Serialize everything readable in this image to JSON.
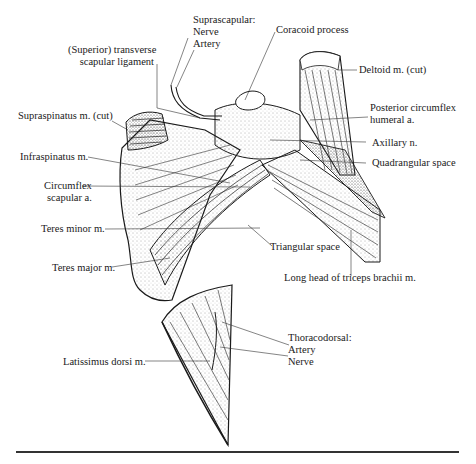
{
  "figure": {
    "labels": {
      "suprascapular_heading": "Suprascapular:",
      "suprascapular_nerve": "Nerve",
      "suprascapular_artery": "Artery",
      "coracoid_process": "Coracoid process",
      "transverse_ligament_line1": "(Superior) transverse",
      "transverse_ligament_line2": "scapular ligament",
      "deltoid": "Deltoid m. (cut)",
      "supraspinatus": "Supraspinatus m. (cut)",
      "posterior_circumflex_line1": "Posterior circumflex",
      "posterior_circumflex_line2": "humeral a.",
      "infraspinatus": "Infraspinatus m.",
      "axillary_nerve": "Axillary n.",
      "quadrangular_space": "Quadrangular space",
      "circumflex_scapular_line1": "Circumflex",
      "circumflex_scapular_line2": "scapular a.",
      "teres_minor": "Teres minor m.",
      "triangular_space": "Triangular space",
      "teres_major": "Teres major m.",
      "long_head_triceps": "Long head of triceps brachii m.",
      "thoracodorsal_heading": "Thoracodorsal:",
      "thoracodorsal_artery": "Artery",
      "thoracodorsal_nerve": "Nerve",
      "latissimus_dorsi": "Latissimus dorsi m."
    },
    "colors": {
      "ink": "#1a1a1a",
      "background": "#ffffff",
      "stipple": "#555555"
    }
  }
}
